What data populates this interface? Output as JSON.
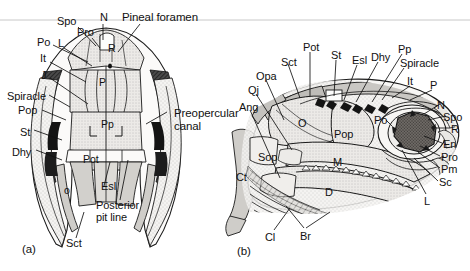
{
  "figure": {
    "type": "anatomical-line-drawing",
    "top_rule": true,
    "panels": [
      {
        "id": "a",
        "caption": "(a)",
        "view": "dorsal",
        "labels": [
          {
            "text": "Spo",
            "x": 57,
            "y": 16,
            "size": "m"
          },
          {
            "text": "N",
            "x": 100,
            "y": 12,
            "size": "m"
          },
          {
            "text": "Pineal foramen",
            "x": 122,
            "y": 12,
            "size": "big"
          },
          {
            "text": "Pro",
            "x": 77,
            "y": 27,
            "size": "m"
          },
          {
            "text": "Po",
            "x": 37,
            "y": 37,
            "size": "m"
          },
          {
            "text": "L",
            "x": 58,
            "y": 38,
            "size": "m"
          },
          {
            "text": "It",
            "x": 40,
            "y": 53,
            "size": "m"
          },
          {
            "text": "J",
            "x": 41,
            "y": 70,
            "size": "m"
          },
          {
            "text": "Spiracle",
            "x": 7,
            "y": 91,
            "size": "m"
          },
          {
            "text": "Pop",
            "x": 18,
            "y": 105,
            "size": "m"
          },
          {
            "text": "St",
            "x": 20,
            "y": 127,
            "size": "m"
          },
          {
            "text": "Dhy",
            "x": 12,
            "y": 147,
            "size": "m"
          },
          {
            "text": "R",
            "x": 108,
            "y": 43,
            "size": "s"
          },
          {
            "text": "P",
            "x": 99,
            "y": 77,
            "size": "s"
          },
          {
            "text": "Pp",
            "x": 101,
            "y": 119,
            "size": "s"
          },
          {
            "text": "Pot",
            "x": 83,
            "y": 154,
            "size": "s"
          },
          {
            "text": "o",
            "x": 64,
            "y": 185,
            "size": "s"
          },
          {
            "text": "Esl",
            "x": 101,
            "y": 181,
            "size": "m"
          },
          {
            "text": "Posterior",
            "x": 96,
            "y": 200,
            "size": "m"
          },
          {
            "text": "pit line",
            "x": 96,
            "y": 212,
            "size": "m"
          },
          {
            "text": "Sct",
            "x": 66,
            "y": 238,
            "size": "m"
          },
          {
            "text": "Preopercular",
            "x": 174,
            "y": 108,
            "size": "big"
          },
          {
            "text": "canal",
            "x": 174,
            "y": 121,
            "size": "big"
          }
        ]
      },
      {
        "id": "b",
        "caption": "(b)",
        "view": "lateral",
        "labels": [
          {
            "text": "Pot",
            "x": 303,
            "y": 42,
            "size": "m"
          },
          {
            "text": "St",
            "x": 331,
            "y": 50,
            "size": "m"
          },
          {
            "text": "Esl",
            "x": 352,
            "y": 55,
            "size": "m"
          },
          {
            "text": "Dhy",
            "x": 371,
            "y": 52,
            "size": "m"
          },
          {
            "text": "Pp",
            "x": 398,
            "y": 44,
            "size": "m"
          },
          {
            "text": "Spiracle",
            "x": 400,
            "y": 58,
            "size": "m"
          },
          {
            "text": "It",
            "x": 407,
            "y": 76,
            "size": "m"
          },
          {
            "text": "P",
            "x": 430,
            "y": 80,
            "size": "m"
          },
          {
            "text": "Sct",
            "x": 281,
            "y": 57,
            "size": "m"
          },
          {
            "text": "Opa",
            "x": 256,
            "y": 71,
            "size": "m"
          },
          {
            "text": "Qj",
            "x": 248,
            "y": 85,
            "size": "m"
          },
          {
            "text": "Ang",
            "x": 239,
            "y": 102,
            "size": "m"
          },
          {
            "text": "O",
            "x": 298,
            "y": 118,
            "size": "m"
          },
          {
            "text": "Pop",
            "x": 334,
            "y": 129,
            "size": "m"
          },
          {
            "text": "Po",
            "x": 374,
            "y": 115,
            "size": "m"
          },
          {
            "text": "M",
            "x": 333,
            "y": 157,
            "size": "m"
          },
          {
            "text": "D",
            "x": 325,
            "y": 187,
            "size": "m"
          },
          {
            "text": "Sop",
            "x": 258,
            "y": 152,
            "size": "m"
          },
          {
            "text": "Ct",
            "x": 236,
            "y": 172,
            "size": "m"
          },
          {
            "text": "N",
            "x": 437,
            "y": 100,
            "size": "m"
          },
          {
            "text": "Spo",
            "x": 443,
            "y": 112,
            "size": "m"
          },
          {
            "text": "R",
            "x": 451,
            "y": 124,
            "size": "m"
          },
          {
            "text": "En",
            "x": 443,
            "y": 139,
            "size": "m"
          },
          {
            "text": "Pro",
            "x": 441,
            "y": 152,
            "size": "m"
          },
          {
            "text": "Pm",
            "x": 441,
            "y": 164,
            "size": "m"
          },
          {
            "text": "Sc",
            "x": 439,
            "y": 177,
            "size": "m"
          },
          {
            "text": "L",
            "x": 424,
            "y": 196,
            "size": "m"
          },
          {
            "text": "Cl",
            "x": 265,
            "y": 232,
            "size": "m"
          },
          {
            "text": "Br",
            "x": 300,
            "y": 231,
            "size": "m"
          }
        ]
      }
    ],
    "captions": {
      "panel_a": "(a)",
      "panel_b": "(b)"
    },
    "colors": {
      "ink": "#111111",
      "line": "#1a1a1a",
      "light_fill": "#f2f1ef",
      "mid_fill": "#cfcdc9",
      "dark_fill": "#3a3a3a",
      "stipple": "#8a8a8a",
      "background": "#ffffff",
      "rule": "#c8c8c8"
    }
  }
}
